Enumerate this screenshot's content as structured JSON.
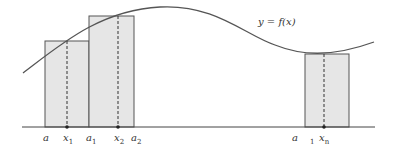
{
  "diagram": {
    "curve_label": "y = f(x)",
    "colors": {
      "fill": "#e6e6e6",
      "stroke": "#555555",
      "curve": "#555555",
      "axis": "#444444"
    },
    "rectangles": [
      {
        "left": 45,
        "right": 89,
        "top": 41,
        "sample_x": 67
      },
      {
        "left": 89,
        "right": 134,
        "top": 16,
        "sample_x": 118
      },
      {
        "left": 305,
        "right": 349,
        "top": 54,
        "sample_x": 324
      }
    ],
    "axis_labels": [
      {
        "text": "a",
        "sub": "",
        "x": 43
      },
      {
        "text": "x",
        "sub": "1",
        "x": 63
      },
      {
        "text": "a",
        "sub": "1",
        "x": 86
      },
      {
        "text": "x",
        "sub": "2",
        "x": 114
      },
      {
        "text": "a",
        "sub": "2",
        "x": 131
      },
      {
        "text": "a",
        "sub": "",
        "x": 292
      },
      {
        "text": "",
        "sub": "1",
        "x": 310
      },
      {
        "text": "x",
        "sub": "n",
        "x": 319
      }
    ]
  }
}
